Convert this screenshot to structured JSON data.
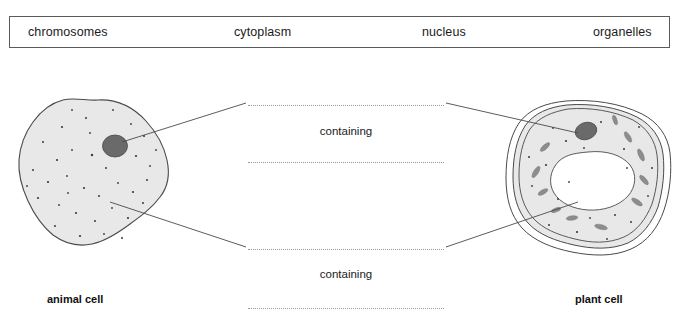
{
  "word_bank": {
    "name": "word-bank",
    "items": [
      {
        "label": "chromosomes"
      },
      {
        "label": "cytoplasm"
      },
      {
        "label": "nucleus"
      },
      {
        "label": "organelles"
      }
    ]
  },
  "diagram": {
    "answer_lines": [
      {
        "id": "answer-line-1",
        "value": ""
      },
      {
        "id": "answer-line-2",
        "value": ""
      },
      {
        "id": "answer-line-3",
        "value": ""
      },
      {
        "id": "answer-line-4",
        "value": ""
      }
    ],
    "connector_labels": {
      "top": "containing",
      "bottom": "containing"
    },
    "cells": [
      {
        "id": "animal-cell",
        "caption": "animal cell",
        "shape": "irregular-blob",
        "features": [
          "nucleus",
          "cytoplasm",
          "organelles"
        ]
      },
      {
        "id": "plant-cell",
        "caption": "plant cell",
        "shape": "rounded-square-with-cell-wall",
        "features": [
          "cell wall",
          "nucleus",
          "vacuole",
          "chloroplasts",
          "cytoplasm",
          "organelles"
        ]
      }
    ]
  },
  "colors": {
    "cell_fill": "#e8e8e8",
    "cell_outline": "#4a4a4a",
    "nucleus_fill": "#6a6a6a",
    "organelle_dot": "#3a3a3a",
    "chloroplast_fill": "#8d8d8d",
    "vacuole_fill": "#ffffff",
    "answer_line": "#9a9a9a",
    "box_border": "#5a5a5a",
    "text": "#1b1b1b"
  }
}
